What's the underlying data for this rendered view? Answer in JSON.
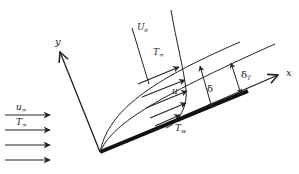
{
  "figure": {
    "colors": {
      "ink": "#222222",
      "background": "#ffffff"
    },
    "labels": {
      "y_axis": "y",
      "x_axis": "x",
      "edge_velocity": "U",
      "edge_velocity_sub": "e",
      "free_temp_profile": "T",
      "free_temp_profile_sub": "∞",
      "local_velocity": "u",
      "velocity_bl_thickness": "δ",
      "thermal_bl_thickness": "δ",
      "thermal_bl_thickness_sub": "T",
      "wall_temp": "T",
      "wall_temp_sub": "w",
      "freestream_velocity": "u",
      "freestream_velocity_sub": "∞",
      "freestream_temp": "T",
      "freestream_temp_sub": "∞"
    },
    "freestream_arrows": 4,
    "profile_arrows": 5
  }
}
